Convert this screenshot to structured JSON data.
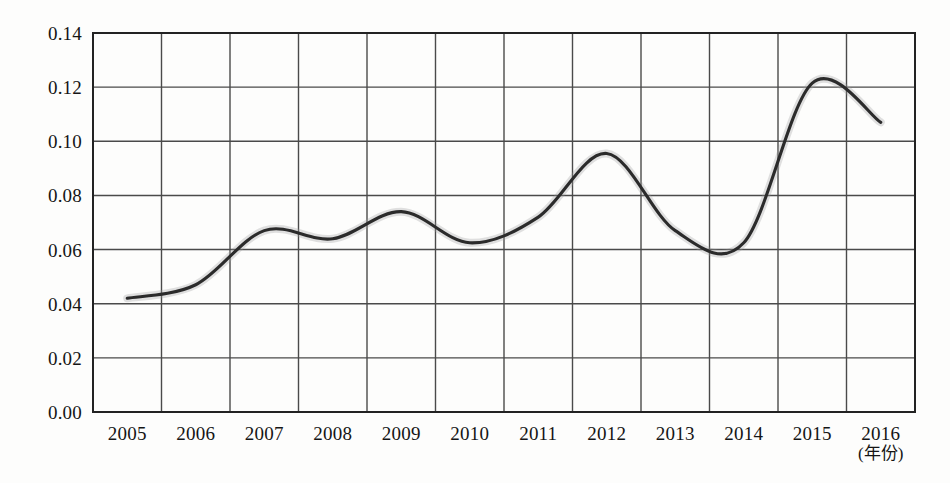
{
  "chart_data": {
    "type": "line",
    "title": "",
    "subtitle": "",
    "xlabel": "(年份)",
    "ylabel": "",
    "categories": [
      "2005",
      "2006",
      "2007",
      "2008",
      "2009",
      "2010",
      "2011",
      "2012",
      "2013",
      "2014",
      "2015",
      "2016"
    ],
    "values": [
      0.042,
      0.047,
      0.067,
      0.064,
      0.074,
      0.0625,
      0.072,
      0.0955,
      0.067,
      0.0625,
      0.1215,
      0.107
    ],
    "series": [
      {
        "name": "",
        "values": [
          0.042,
          0.047,
          0.067,
          0.064,
          0.074,
          0.0625,
          0.072,
          0.0955,
          0.067,
          0.0625,
          0.1215,
          0.107
        ]
      }
    ],
    "ylim": [
      0.0,
      0.14
    ],
    "ytick_labels": [
      "0.00",
      "0.02",
      "0.04",
      "0.06",
      "0.08",
      "0.10",
      "0.12",
      "0.14"
    ],
    "ytick_values": [
      0.0,
      0.02,
      0.04,
      0.06,
      0.08,
      0.1,
      0.12,
      0.14
    ],
    "xtick_labels": [
      "2005",
      "2006",
      "2007",
      "2008",
      "2009",
      "2010",
      "2011",
      "2012",
      "2013",
      "2014",
      "2015",
      "2016"
    ],
    "grid": "both",
    "legend": "none",
    "line_color": "#2b2b2b",
    "grid_color": "#4a4a4a",
    "axis_color": "#222222",
    "background_color": "#fdfdfc",
    "smoothing": "spline"
  },
  "axis": {
    "x_unit_note": "(年份)",
    "last_year_label": "2016"
  }
}
